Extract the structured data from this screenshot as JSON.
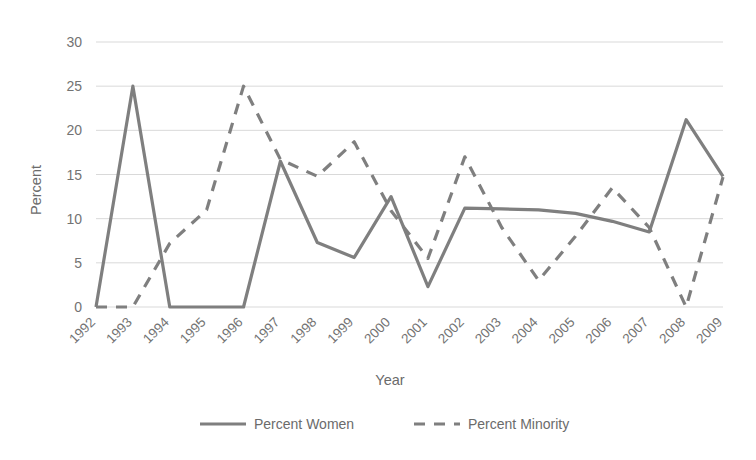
{
  "chart_data": {
    "type": "line",
    "title": "",
    "xlabel": "Year",
    "ylabel": "Percent",
    "ylim": [
      0,
      30
    ],
    "yticks": [
      0,
      5,
      10,
      15,
      20,
      25,
      30
    ],
    "grid": true,
    "legend_position": "bottom",
    "categories": [
      "1992",
      "1993",
      "1994",
      "1995",
      "1996",
      "1997",
      "1998",
      "1999",
      "2000",
      "2001",
      "2002",
      "2003",
      "2004",
      "2005",
      "2006",
      "2007",
      "2008",
      "2009"
    ],
    "series": [
      {
        "name": "Percent Women",
        "style": "solid",
        "color": "#7f7f7f",
        "values": [
          0,
          25,
          0,
          0,
          0,
          16.5,
          7.3,
          5.6,
          12.5,
          2.3,
          11.2,
          11.1,
          11.0,
          10.6,
          9.7,
          8.5,
          21.2,
          14.8
        ]
      },
      {
        "name": "Percent Minority",
        "style": "dashed",
        "color": "#7f7f7f",
        "values": [
          0,
          0,
          7.2,
          11.0,
          25.0,
          16.7,
          14.8,
          18.7,
          10.9,
          5.5,
          17.0,
          9.0,
          3.0,
          8.0,
          13.5,
          9.0,
          0.0,
          14.7
        ]
      }
    ]
  },
  "legend": {
    "items": [
      {
        "label": "Percent Women",
        "style": "solid"
      },
      {
        "label": "Percent Minority",
        "style": "dashed"
      }
    ]
  },
  "colors": {
    "line": "#7f7f7f",
    "grid": "#d9d9d9",
    "text": "#6b6b6b",
    "background": "#ffffff"
  }
}
